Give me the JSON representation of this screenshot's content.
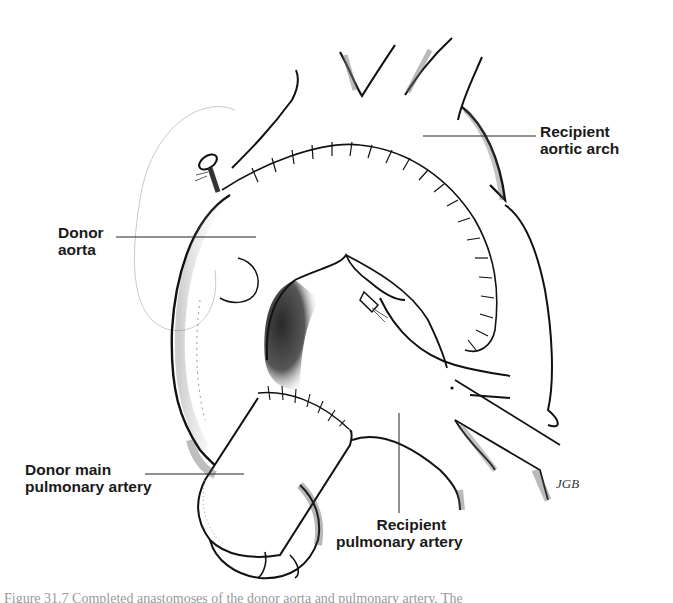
{
  "figure": {
    "type": "surgical illustration",
    "labels": {
      "recipient_aortic_arch": {
        "line1": "Recipient",
        "line2": "aortic arch"
      },
      "donor_aorta": {
        "line1": "Donor",
        "line2": "aorta"
      },
      "donor_main_pulmonary_artery": {
        "line1": "Donor main",
        "line2": "pulmonary artery"
      },
      "recipient_pulmonary_artery": {
        "line1": "Recipient",
        "line2": "pulmonary artery"
      }
    },
    "signature": "JGB",
    "caption_clipped": "Figure 31.7  Completed anastomoses of the donor aorta and pulmonary artery. The"
  },
  "colors": {
    "ink": "#1a1a1a",
    "background": "#ffffff",
    "shade": "#888888"
  }
}
